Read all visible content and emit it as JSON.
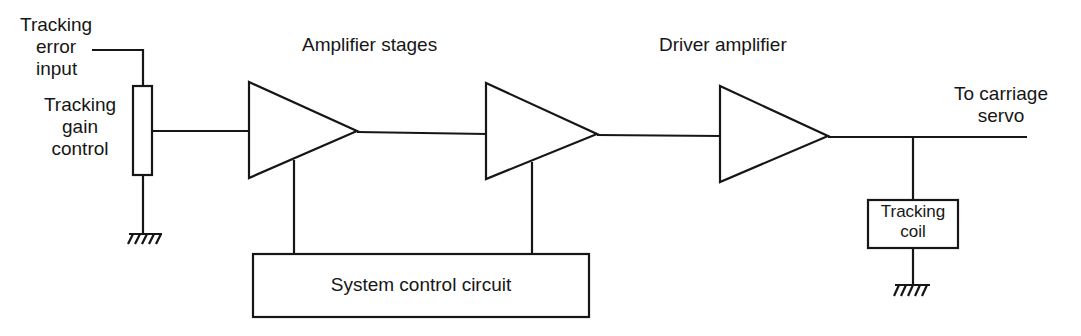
{
  "diagram": {
    "type": "block-diagram",
    "labels": {
      "tracking_error_input": [
        "Tracking",
        "error",
        "input"
      ],
      "tracking_gain_control": [
        "Tracking",
        "gain",
        "control"
      ],
      "amplifier_stages": "Amplifier stages",
      "driver_amplifier": "Driver amplifier",
      "to_carriage_servo": [
        "To carriage",
        "servo"
      ],
      "system_control_circuit": "System control circuit",
      "tracking_coil": [
        "Tracking",
        "coil"
      ]
    },
    "nodes": [
      {
        "id": "input",
        "label": "Tracking error input",
        "kind": "terminal"
      },
      {
        "id": "gain",
        "label": "Tracking gain control",
        "kind": "potentiometer"
      },
      {
        "id": "amp1",
        "label": "Amplifier stage 1",
        "kind": "amplifier"
      },
      {
        "id": "amp2",
        "label": "Amplifier stage 2",
        "kind": "amplifier"
      },
      {
        "id": "driver",
        "label": "Driver amplifier",
        "kind": "amplifier"
      },
      {
        "id": "syscontrol",
        "label": "System control circuit",
        "kind": "block"
      },
      {
        "id": "coil",
        "label": "Tracking coil",
        "kind": "block"
      },
      {
        "id": "output",
        "label": "To carriage servo",
        "kind": "terminal"
      },
      {
        "id": "gnd1",
        "label": "Ground",
        "kind": "ground"
      },
      {
        "id": "gnd2",
        "label": "Ground",
        "kind": "ground"
      }
    ],
    "edges": [
      {
        "from": "input",
        "to": "gain"
      },
      {
        "from": "gain",
        "to": "gnd1"
      },
      {
        "from": "gain",
        "to": "amp1"
      },
      {
        "from": "amp1",
        "to": "amp2"
      },
      {
        "from": "amp2",
        "to": "driver"
      },
      {
        "from": "driver",
        "to": "output"
      },
      {
        "from": "driver",
        "to": "coil"
      },
      {
        "from": "coil",
        "to": "gnd2"
      },
      {
        "from": "syscontrol",
        "to": "amp1"
      },
      {
        "from": "syscontrol",
        "to": "amp2"
      }
    ]
  }
}
